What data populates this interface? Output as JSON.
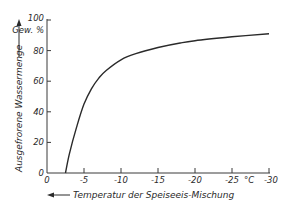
{
  "chart_data": {
    "type": "line",
    "title": "",
    "xlabel": "Temperatur der Speiseeis-Mischung",
    "xlabel_arrow": "left",
    "x_unit": "°C",
    "ylabel": "Ausgefrorene Wassermenge",
    "ylabel_arrow": "up",
    "y_unit": "Gew. %",
    "xlim": [
      0,
      -30
    ],
    "ylim": [
      0,
      100
    ],
    "x_ticks": [
      0,
      -5,
      -10,
      -15,
      -20,
      -25,
      -30
    ],
    "x_tick_labels": [
      "0",
      "-5",
      "-10",
      "-15",
      "-20",
      "-25",
      "-30"
    ],
    "y_ticks": [
      0,
      20,
      40,
      60,
      80,
      100
    ],
    "y_tick_labels": [
      "0",
      "20",
      "40",
      "60",
      "80",
      "100"
    ],
    "grid": false,
    "legend": null,
    "series": [
      {
        "name": "Ausgefrorene Wassermenge",
        "color": "#2a2a2a",
        "x": [
          -2.5,
          -3,
          -4,
          -5,
          -6,
          -7,
          -8,
          -10,
          -12,
          -15,
          -18,
          -20,
          -25,
          -30
        ],
        "y": [
          0,
          12,
          30,
          45,
          55,
          62,
          67,
          74,
          78,
          82,
          85,
          86.5,
          89,
          91
        ]
      }
    ]
  },
  "labels": {
    "x_title": "Temperatur der Speiseeis-Mischung",
    "y_title": "Ausgefrorene Wassermenge",
    "y_unit": "Gew. %",
    "x_unit": "°C",
    "x_ticks": [
      "0",
      "-5",
      "-10",
      "-15",
      "-20",
      "-25",
      "-30"
    ],
    "y_ticks": [
      "0",
      "20",
      "40",
      "60",
      "80",
      "100"
    ]
  }
}
